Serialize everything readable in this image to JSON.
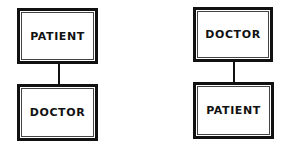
{
  "diagrams": [
    {
      "top": "PATIENT",
      "bottom": "DOCTOR"
    },
    {
      "top": "DOCTOR",
      "bottom": "PATIENT"
    }
  ]
}
